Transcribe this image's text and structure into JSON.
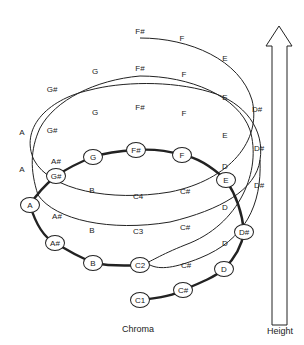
{
  "diagram": {
    "bottom_coil_nodes": [
      {
        "label": "C1",
        "x": 140,
        "y": 300
      },
      {
        "label": "C#",
        "x": 183,
        "y": 290
      },
      {
        "label": "D",
        "x": 224,
        "y": 269
      },
      {
        "label": "D#",
        "x": 244,
        "y": 232
      },
      {
        "label": "E",
        "x": 226,
        "y": 180
      },
      {
        "label": "F",
        "x": 182,
        "y": 155
      },
      {
        "label": "F#",
        "x": 136,
        "y": 150
      },
      {
        "label": "G",
        "x": 93,
        "y": 157
      },
      {
        "label": "G#",
        "x": 56,
        "y": 176
      },
      {
        "label": "A",
        "x": 30,
        "y": 205
      },
      {
        "label": "A#",
        "x": 55,
        "y": 243
      },
      {
        "label": "B",
        "x": 93,
        "y": 263
      },
      {
        "label": "C2",
        "x": 140,
        "y": 265
      }
    ],
    "coil_labels": [
      {
        "label": "C#",
        "x": 186,
        "y": 265
      },
      {
        "label": "D",
        "x": 225,
        "y": 243
      },
      {
        "label": "C3",
        "x": 138,
        "y": 231
      },
      {
        "label": "C#",
        "x": 185,
        "y": 227
      },
      {
        "label": "D",
        "x": 225,
        "y": 207
      },
      {
        "label": "D#",
        "x": 259,
        "y": 185
      },
      {
        "label": "B",
        "x": 92,
        "y": 230
      },
      {
        "label": "A#",
        "x": 57,
        "y": 216
      },
      {
        "label": "C4",
        "x": 138,
        "y": 196
      },
      {
        "label": "C#",
        "x": 185,
        "y": 191
      },
      {
        "label": "B",
        "x": 92,
        "y": 190
      },
      {
        "label": "D",
        "x": 225,
        "y": 166
      },
      {
        "label": "D#",
        "x": 259,
        "y": 148
      },
      {
        "label": "A#",
        "x": 56,
        "y": 161
      },
      {
        "label": "A",
        "x": 22,
        "y": 169
      },
      {
        "label": "E",
        "x": 225,
        "y": 135
      },
      {
        "label": "G#",
        "x": 52,
        "y": 130
      },
      {
        "label": "G",
        "x": 95,
        "y": 112
      },
      {
        "label": "F#",
        "x": 140,
        "y": 107
      },
      {
        "label": "F",
        "x": 184,
        "y": 113
      },
      {
        "label": "D#",
        "x": 257,
        "y": 109
      },
      {
        "label": "A",
        "x": 22,
        "y": 132
      },
      {
        "label": "E",
        "x": 225,
        "y": 97
      },
      {
        "label": "G#",
        "x": 52,
        "y": 89
      },
      {
        "label": "G",
        "x": 95,
        "y": 71
      },
      {
        "label": "F#",
        "x": 140,
        "y": 68
      },
      {
        "label": "F",
        "x": 184,
        "y": 74
      },
      {
        "label": "E",
        "x": 225,
        "y": 58
      },
      {
        "label": "F#",
        "x": 140,
        "y": 31
      },
      {
        "label": "F",
        "x": 182,
        "y": 38
      }
    ],
    "axis_captions": {
      "chroma": "Chroma",
      "height": "Height"
    },
    "colors": {
      "line": "#222222",
      "background": "#ffffff"
    }
  }
}
